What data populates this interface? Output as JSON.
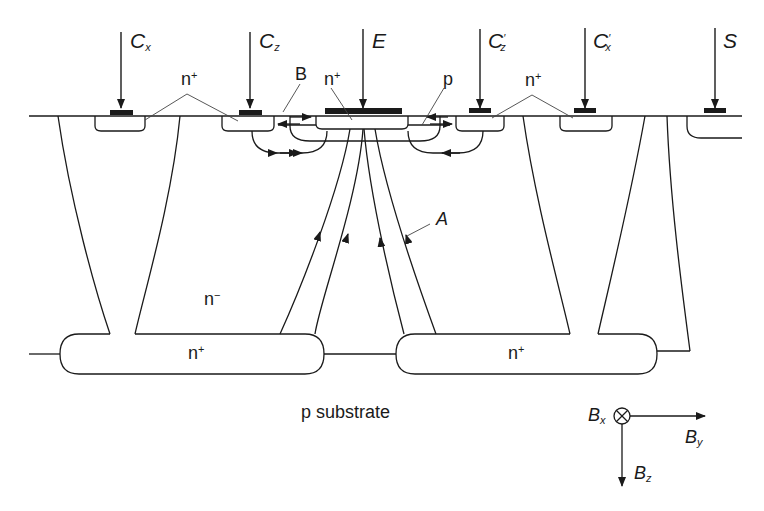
{
  "diagram": {
    "terminals": [
      {
        "id": "cx",
        "label": "C",
        "sub": "x",
        "prime": ""
      },
      {
        "id": "cz",
        "label": "C",
        "sub": "z",
        "prime": ""
      },
      {
        "id": "e",
        "label": "E",
        "sub": "",
        "prime": ""
      },
      {
        "id": "czp",
        "label": "C",
        "sub": "z",
        "prime": "′"
      },
      {
        "id": "cxp",
        "label": "C",
        "sub": "x",
        "prime": "′"
      },
      {
        "id": "s",
        "label": "S",
        "sub": "",
        "prime": ""
      }
    ],
    "region_labels": {
      "n_plus_left": "n",
      "n_plus_sup": "+",
      "b": "B",
      "n_plus_emitter": "n",
      "p": "p",
      "n_plus_right": "n",
      "n_minus": "n",
      "n_minus_sup": "−",
      "buried_left": "n",
      "buried_right": "n",
      "a": "A",
      "substrate": "p substrate"
    },
    "axes": {
      "bx": "B",
      "bx_sub": "x",
      "by": "B",
      "by_sub": "y",
      "bz": "B",
      "bz_sub": "z"
    }
  }
}
